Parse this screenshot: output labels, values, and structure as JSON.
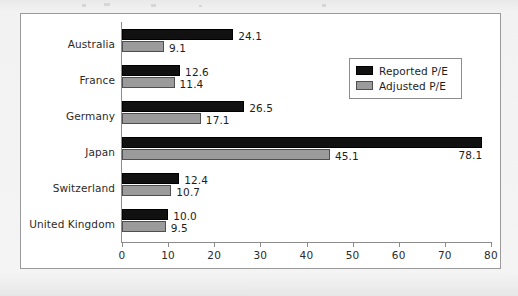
{
  "figure": {
    "background_color": "#ffffff",
    "frame_color": "#9a9a9a",
    "page_color": "#efefef"
  },
  "chart_data": {
    "type": "bar",
    "orientation": "horizontal",
    "title": "",
    "subtitle": "",
    "xlabel": "",
    "ylabel": "",
    "xlim": [
      0,
      80
    ],
    "ylim": null,
    "grid": false,
    "legend_position": "upper right",
    "categories": [
      "Australia",
      "France",
      "Germany",
      "Japan",
      "Switzerland",
      "United Kingdom"
    ],
    "xticks": [
      0,
      10,
      20,
      30,
      40,
      50,
      60,
      70,
      80
    ],
    "xtick_labels": [
      "0",
      "10",
      "20",
      "30",
      "40",
      "50",
      "60",
      "70",
      "80"
    ],
    "series": [
      {
        "name": "Reported P/E",
        "color": "#111111",
        "values": [
          24.1,
          12.6,
          26.5,
          78.1,
          12.4,
          10.0
        ],
        "value_labels": [
          "24.1",
          "12.6",
          "26.5",
          "78.1",
          "12.4",
          "10.0"
        ]
      },
      {
        "name": "Adjusted P/E",
        "color": "#9b9b9b",
        "values": [
          9.1,
          11.4,
          17.1,
          45.1,
          10.7,
          9.5
        ],
        "value_labels": [
          "9.1",
          "11.4",
          "17.1",
          "45.1",
          "10.7",
          "9.5"
        ]
      }
    ]
  },
  "legend": {
    "entries": [
      {
        "label": "Reported P/E",
        "color": "#111111"
      },
      {
        "label": "Adjusted P/E",
        "color": "#9b9b9b"
      }
    ]
  }
}
